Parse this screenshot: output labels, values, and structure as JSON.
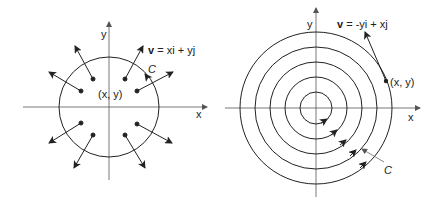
{
  "figures": [
    {
      "name": "radial-field",
      "labels": {
        "y_axis": "y",
        "x_axis": "x",
        "field_v": "v",
        "field_eq": " = xi + yj",
        "curve": "C",
        "point": "(x, y)"
      }
    },
    {
      "name": "rotational-field",
      "labels": {
        "y_axis": "y",
        "x_axis": "x",
        "field_v": "v",
        "field_eq": " = -yi + xj",
        "curve": "C",
        "point": "(x, y)"
      }
    }
  ],
  "colors": {
    "stroke": "#222222",
    "axis": "#555555",
    "background": "#ffffff"
  }
}
